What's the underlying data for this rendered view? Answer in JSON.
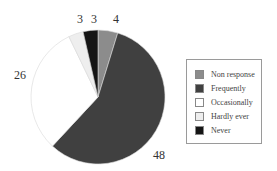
{
  "chart_data": {
    "type": "pie",
    "title": "",
    "categories": [
      "Non response",
      "Frequently",
      "Occasionally",
      "Hardly ever",
      "Never"
    ],
    "values": [
      4,
      48,
      26,
      3,
      3
    ],
    "colors": [
      "#8c8c8c",
      "#404040",
      "#ffffff",
      "#eeeeee",
      "#151515"
    ],
    "start_angle": "12 o'clock",
    "direction": "clockwise",
    "legend_position": "right"
  },
  "labels": {
    "non_response": "4",
    "frequently": "48",
    "occasionally": "26",
    "hardly_ever": "3",
    "never": "3"
  },
  "legend": {
    "items": [
      {
        "label": "Non response",
        "color": "#8c8c8c"
      },
      {
        "label": "Frequently",
        "color": "#404040"
      },
      {
        "label": "Occasionally",
        "color": "#ffffff"
      },
      {
        "label": "Hardly ever",
        "color": "#eeeeee"
      },
      {
        "label": "Never",
        "color": "#151515"
      }
    ]
  }
}
